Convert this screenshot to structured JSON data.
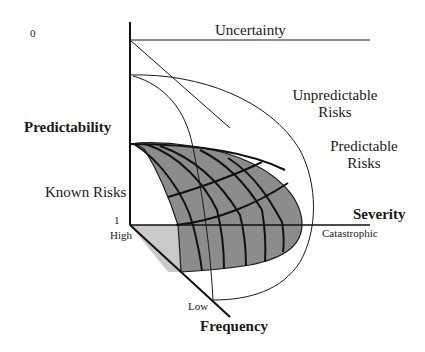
{
  "diagram": {
    "colors": {
      "background": "#ffffff",
      "line": "#1a1a1a",
      "surface_dark": "#8c8c8c",
      "surface_light": "#c9c9c9"
    },
    "axes": {
      "predictability": {
        "label": "Predictability",
        "top_tick": "0",
        "bottom_tick": "1"
      },
      "severity": {
        "label": "Severity",
        "end_label": "Catastrophic"
      },
      "frequency": {
        "label": "Frequency",
        "start_label": "High",
        "end_label": "Low"
      }
    },
    "regions": {
      "uncertainty": "Uncertainty",
      "unpredictable": [
        "Unpredictable",
        "Risks"
      ],
      "predictable": [
        "Predictable",
        "Risks"
      ],
      "known": "Known Risks"
    }
  }
}
